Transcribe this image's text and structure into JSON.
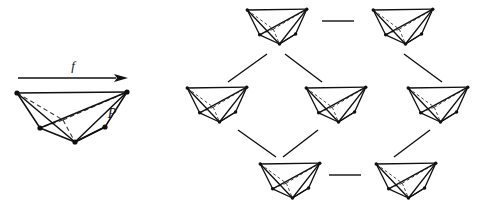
{
  "figure": {
    "domain": "Diagram",
    "background_color": "#ffffff",
    "ink_color": "#101010",
    "dashed_color": "#3a3a3a",
    "width": 493,
    "height": 212
  },
  "labels": {
    "map_label": "f",
    "polytope_label": "P"
  },
  "arrow": {
    "name": "map-arrow",
    "x1": 18,
    "y1": 78,
    "x2": 128,
    "y2": 78,
    "head_length": 14,
    "head_width": 8
  },
  "main_polytope": {
    "name": "polytope-P",
    "vertices": {
      "tl": [
        17,
        93
      ],
      "tr": [
        127,
        92
      ],
      "bl": [
        40,
        128
      ],
      "bc": [
        75,
        142
      ],
      "br": [
        105,
        127
      ],
      "hidden_mid": [
        63,
        120
      ]
    },
    "solid_edges": [
      [
        "tl",
        "tr"
      ],
      [
        "tl",
        "bl"
      ],
      [
        "bl",
        "bc"
      ],
      [
        "bc",
        "br"
      ],
      [
        "br",
        "tr"
      ],
      [
        "tl",
        "bc"
      ],
      [
        "bl",
        "tr"
      ],
      [
        "bc",
        "tr"
      ],
      [
        "br",
        "bc"
      ]
    ],
    "dashed_edges": [
      [
        "tl",
        "hidden_mid"
      ],
      [
        "hidden_mid",
        "tr"
      ],
      [
        "hidden_mid",
        "bl"
      ],
      [
        "hidden_mid",
        "bc"
      ]
    ],
    "vertex_dots": [
      "tl",
      "tr",
      "bl",
      "bc",
      "br"
    ],
    "dot_radius": 2.6,
    "label_P_position": [
      112,
      118
    ]
  },
  "lattice": {
    "name": "face-lattice",
    "node_width": 62,
    "node_height": 40,
    "nodes": [
      {
        "id": "t1",
        "name": "lattice-node-top-left",
        "row": 0,
        "x": 246,
        "y": 6
      },
      {
        "id": "t2",
        "name": "lattice-node-top-right",
        "row": 0,
        "x": 372,
        "y": 6
      },
      {
        "id": "m1",
        "name": "lattice-node-mid-left",
        "row": 1,
        "x": 186,
        "y": 84
      },
      {
        "id": "m2",
        "name": "lattice-node-mid-center",
        "row": 1,
        "x": 305,
        "y": 84
      },
      {
        "id": "m3",
        "name": "lattice-node-mid-right",
        "row": 1,
        "x": 407,
        "y": 84
      },
      {
        "id": "b1",
        "name": "lattice-node-bottom-left",
        "row": 2,
        "x": 259,
        "y": 160
      },
      {
        "id": "b2",
        "name": "lattice-node-bottom-right",
        "row": 2,
        "x": 375,
        "y": 160
      }
    ],
    "edges": [
      {
        "name": "lattice-edge-top-horizontal",
        "type": "horizontal",
        "x1": 322,
        "y1": 21,
        "x2": 354,
        "y2": 21
      },
      {
        "name": "lattice-edge-t1-m1",
        "type": "diagonal",
        "x1": 267,
        "y1": 54,
        "x2": 228,
        "y2": 82
      },
      {
        "name": "lattice-edge-t1-m2",
        "type": "diagonal",
        "x1": 285,
        "y1": 54,
        "x2": 322,
        "y2": 82
      },
      {
        "name": "lattice-edge-t2-m3",
        "type": "diagonal",
        "x1": 404,
        "y1": 54,
        "x2": 442,
        "y2": 82
      },
      {
        "name": "lattice-edge-m1-b1",
        "type": "diagonal",
        "x1": 238,
        "y1": 130,
        "x2": 276,
        "y2": 157
      },
      {
        "name": "lattice-edge-m2-b1",
        "type": "diagonal",
        "x1": 318,
        "y1": 130,
        "x2": 283,
        "y2": 157
      },
      {
        "name": "lattice-edge-m3-b2",
        "type": "diagonal",
        "x1": 430,
        "y1": 130,
        "x2": 394,
        "y2": 157
      },
      {
        "name": "lattice-edge-bottom-horizontal",
        "type": "horizontal",
        "x1": 329,
        "y1": 175,
        "x2": 361,
        "y2": 175
      }
    ]
  },
  "node_shape": {
    "description": "Normalized unit-box polytope outline used for every lattice node",
    "unit_vertices": {
      "tl": [
        0.02,
        0.1
      ],
      "tr": [
        0.98,
        0.08
      ],
      "bl": [
        0.22,
        0.72
      ],
      "bc": [
        0.54,
        0.95
      ],
      "br": [
        0.8,
        0.7
      ],
      "hidden_mid": [
        0.44,
        0.58
      ]
    },
    "solid_edges": [
      [
        "tl",
        "tr"
      ],
      [
        "tl",
        "bl"
      ],
      [
        "bl",
        "bc"
      ],
      [
        "bc",
        "br"
      ],
      [
        "br",
        "tr"
      ],
      [
        "tl",
        "bc"
      ],
      [
        "bl",
        "tr"
      ],
      [
        "bc",
        "tr"
      ],
      [
        "br",
        "bc"
      ]
    ],
    "dashed_edges": [
      [
        "tl",
        "hidden_mid"
      ],
      [
        "hidden_mid",
        "tr"
      ],
      [
        "hidden_mid",
        "bl"
      ],
      [
        "hidden_mid",
        "bc"
      ]
    ],
    "vertex_dots": [
      "tl",
      "tr",
      "bl",
      "bc",
      "br"
    ],
    "dot_radius": 1.7
  }
}
